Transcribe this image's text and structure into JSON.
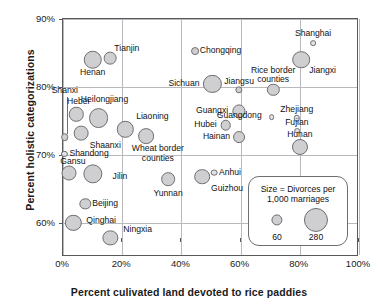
{
  "chart_data": {
    "type": "scatter",
    "title": "",
    "xlabel": "Percent culivated land devoted to rice paddies",
    "ylabel": "Percent holistic categorizations",
    "xlim": [
      0,
      100
    ],
    "ylim": [
      55,
      90
    ],
    "xticks": [
      "0%",
      "20%",
      "40%",
      "60%",
      "80%",
      "100%"
    ],
    "xtick_values": [
      0,
      20,
      40,
      60,
      80,
      100
    ],
    "yticks": [
      "60%",
      "70%",
      "80%",
      "90%"
    ],
    "ytick_values": [
      60,
      70,
      80,
      90
    ],
    "grid": true,
    "size_encoding": "Divorces per 1,000 marriages",
    "points": [
      {
        "name": "Henan",
        "x": 10,
        "y": 84.0,
        "size": 165,
        "label_pos": "below",
        "label_dx": 0,
        "label_dy": 13
      },
      {
        "name": "Tianjin",
        "x": 16,
        "y": 84.2,
        "size": 78,
        "label_pos": "above-right",
        "label_dx": 4,
        "label_dy": -9
      },
      {
        "name": "Chongqing",
        "x": 44.5,
        "y": 85.3,
        "size": 30,
        "label_pos": "right",
        "label_dx": 5,
        "label_dy": 0
      },
      {
        "name": "Shanghai",
        "x": 84.5,
        "y": 86.5,
        "size": 16,
        "label_pos": "above",
        "label_dx": 0,
        "label_dy": -9
      },
      {
        "name": "Jiangxi",
        "x": 80.5,
        "y": 84.0,
        "size": 150,
        "label_pos": "below-right",
        "label_dx": 8,
        "label_dy": 11
      },
      {
        "name": "Sichuan",
        "x": 50.5,
        "y": 80.4,
        "size": 160,
        "label_pos": "left",
        "label_dx": -13,
        "label_dy": 0
      },
      {
        "name": "Jiangsu",
        "x": 59.5,
        "y": 79.6,
        "size": 26,
        "label_pos": "above",
        "label_dx": 0,
        "label_dy": -8
      },
      {
        "name": "Rice border counties",
        "x": 71,
        "y": 79.6,
        "size": 74,
        "label_pos": "above",
        "label_dx": 0,
        "label_dy": -19
      },
      {
        "name": "Shanxi",
        "x": 0.6,
        "y": 72.6,
        "size": 28,
        "label_pos": "leader",
        "label_dx": 0,
        "label_dy": -46
      },
      {
        "name": "Hebei",
        "x": 4.5,
        "y": 76.0,
        "size": 100,
        "label_pos": "above",
        "label_dx": 2,
        "label_dy": -12
      },
      {
        "name": "Heilongjiang",
        "x": 12,
        "y": 75.4,
        "size": 190,
        "label_pos": "above",
        "label_dx": 6,
        "label_dy": -18
      },
      {
        "name": "Liaoning",
        "x": 21,
        "y": 73.8,
        "size": 130,
        "label_pos": "above-right",
        "label_dx": 11,
        "label_dy": -12
      },
      {
        "name": "Shaanxi",
        "x": 6,
        "y": 73.2,
        "size": 105,
        "label_pos": "below-right",
        "label_dx": 9,
        "label_dy": 13
      },
      {
        "name": "Wheat border counties",
        "x": 28,
        "y": 72.8,
        "size": 120,
        "label_pos": "below-right",
        "label_dx": 12,
        "label_dy": 13
      },
      {
        "name": "Guangxi",
        "x": 59.5,
        "y": 76.4,
        "size": 84,
        "label_pos": "left",
        "label_dx": -11,
        "label_dy": 0
      },
      {
        "name": "Guangdong",
        "x": 70.5,
        "y": 75.6,
        "size": 16,
        "label_pos": "left",
        "label_dx": -10,
        "label_dy": -1
      },
      {
        "name": "Zhejiang",
        "x": 79,
        "y": 75.4,
        "size": 20,
        "label_pos": "above",
        "label_dx": 0,
        "label_dy": -8
      },
      {
        "name": "Hubei",
        "x": 55,
        "y": 74.4,
        "size": 54,
        "label_pos": "left",
        "label_dx": -9,
        "label_dy": 0
      },
      {
        "name": "Fujian",
        "x": 79,
        "y": 73.6,
        "size": 16,
        "label_pos": "above",
        "label_dx": 0,
        "label_dy": -8
      },
      {
        "name": "Hainan",
        "x": 59.5,
        "y": 72.6,
        "size": 68,
        "label_pos": "left",
        "label_dx": -9,
        "label_dy": 0
      },
      {
        "name": "Hunan",
        "x": 80,
        "y": 71.2,
        "size": 124,
        "label_pos": "above",
        "label_dx": 0,
        "label_dy": -12
      },
      {
        "name": "Shandong",
        "x": 0.5,
        "y": 70.2,
        "size": 18,
        "label_pos": "right",
        "label_dx": 5,
        "label_dy": 0
      },
      {
        "name": "Gansu",
        "x": 2,
        "y": 67.4,
        "size": 108,
        "label_pos": "above",
        "label_dx": 4,
        "label_dy": -11
      },
      {
        "name": "Jilin",
        "x": 10,
        "y": 67.2,
        "size": 180,
        "label_pos": "right",
        "label_dx": 20,
        "label_dy": 3
      },
      {
        "name": "Yunnan",
        "x": 35.5,
        "y": 66.4,
        "size": 90,
        "label_pos": "below",
        "label_dx": 0,
        "label_dy": 15
      },
      {
        "name": "Guizhou",
        "x": 47,
        "y": 66.8,
        "size": 118,
        "label_pos": "below-right",
        "label_dx": 9,
        "label_dy": 12
      },
      {
        "name": "Anhui",
        "x": 51,
        "y": 67.4,
        "size": 22,
        "label_pos": "right",
        "label_dx": 5,
        "label_dy": 0
      },
      {
        "name": "Beijing",
        "x": 7.5,
        "y": 62.8,
        "size": 62,
        "label_pos": "right",
        "label_dx": 7,
        "label_dy": 0
      },
      {
        "name": "Qinghai",
        "x": 3.5,
        "y": 60.0,
        "size": 128,
        "label_pos": "right",
        "label_dx": 13,
        "label_dy": -2
      },
      {
        "name": "Ningxia",
        "x": 16,
        "y": 57.8,
        "size": 112,
        "label_pos": "above-right",
        "label_dx": 13,
        "label_dy": -8
      }
    ]
  },
  "legend": {
    "title_line1": "Size = Divorces per",
    "title_line2": "1,000 marriages",
    "small_value": "60",
    "large_value": "280",
    "small_size": 60,
    "large_size": 280
  },
  "colors": {
    "bubble_fill": "#cfcfd1",
    "bubble_stroke": "#6e6e72",
    "grid": "#b9b9bd",
    "frame": "#59595c",
    "text": "#111111"
  }
}
